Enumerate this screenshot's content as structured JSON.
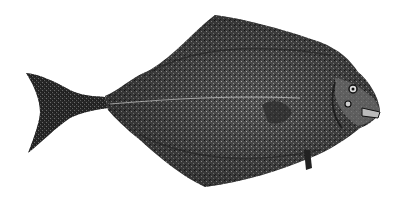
{
  "image": {
    "subject": "flatfish illustration",
    "description": "Engraved-style black and white illustration of a halibut, facing right, with forked tail on the left",
    "colors": {
      "background": "#ffffff",
      "body_dark": "#1a1a1a",
      "body_mid": "#4a4a4a",
      "body_light": "#7a7a7a",
      "highlight": "#bdbdbd"
    }
  }
}
